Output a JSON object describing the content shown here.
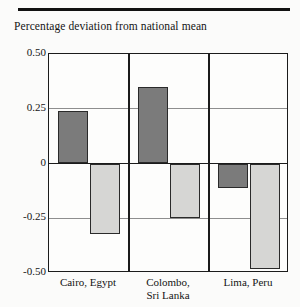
{
  "chart_data": {
    "type": "bar",
    "title": "Percentage deviation from national mean",
    "xlabel": "",
    "ylabel": "",
    "ylim": [
      -0.5,
      0.5
    ],
    "yticks": [
      "0.50",
      "0.25",
      "0",
      "-0.25",
      "-0.50"
    ],
    "ytick_values": [
      0.5,
      0.25,
      0,
      -0.25,
      -0.5
    ],
    "grid": true,
    "legend": "none",
    "categories": [
      "Cairo, Egypt",
      "Colombo, Sri Lanka",
      "Lima, Peru"
    ],
    "category_lines": [
      [
        "Cairo, Egypt"
      ],
      [
        "Colombo,",
        "Sri Lanka"
      ],
      [
        "Lima, Peru"
      ]
    ],
    "series": [
      {
        "name": "dark",
        "color": "#7b7b7b",
        "values": [
          0.24,
          0.35,
          -0.11
        ]
      },
      {
        "name": "light",
        "color": "#d6d6d4",
        "values": [
          -0.32,
          -0.25,
          -0.48
        ]
      }
    ]
  },
  "figure": {
    "title": "Percentage deviation from national mean"
  }
}
